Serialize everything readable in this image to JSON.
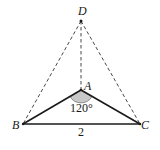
{
  "figure": {
    "points": {
      "D": {
        "label": "D",
        "x": 81,
        "y": 21
      },
      "A": {
        "label": "A",
        "x": 81,
        "y": 90
      },
      "B": {
        "label": "B",
        "x": 23,
        "y": 124
      },
      "C": {
        "label": "C",
        "x": 140,
        "y": 124
      }
    },
    "angle_label": "120°",
    "side_label": "2",
    "colors": {
      "line": "#1a1a1a",
      "dashed": "#333333",
      "angle_fill": "#c8c8c8",
      "background": "#ffffff"
    }
  }
}
